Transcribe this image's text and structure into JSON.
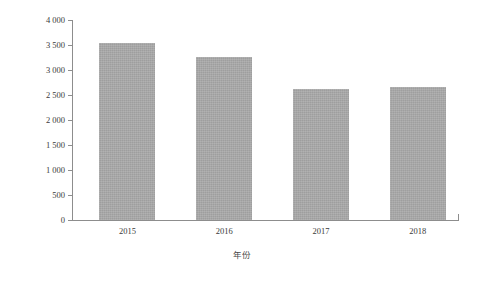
{
  "chart_data": {
    "type": "bar",
    "title": "",
    "categories": [
      "2015",
      "2016",
      "2017",
      "2018"
    ],
    "values": [
      3545,
      3270,
      2620,
      2660
    ],
    "series": [
      {
        "name": "工业企业数",
        "values": [
          3545,
          3270,
          2620,
          2660
        ]
      }
    ],
    "xlabel": "年份",
    "ylabel": "工业企业数/家",
    "ylim": [
      0,
      4000
    ],
    "xlim_note": "categorical",
    "ytick_labels": [
      "0",
      "500",
      "1 000",
      "1 500",
      "2 000",
      "2 500",
      "3 000",
      "3 500",
      "4 000"
    ],
    "ytick_values": [
      0,
      500,
      1000,
      1500,
      2000,
      2500,
      3000,
      3500,
      4000
    ],
    "grid": false,
    "legend": "none",
    "bar_color": "#a9a9a9",
    "axis_color": "#8d8d8d",
    "background": "#ffffff"
  }
}
